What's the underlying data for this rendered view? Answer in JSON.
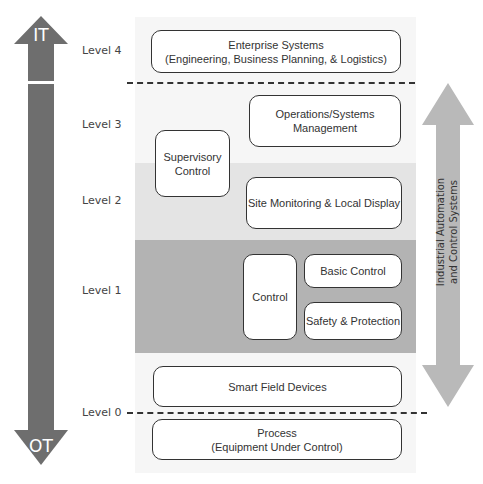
{
  "left_arrow": {
    "top_label": "IT",
    "bottom_label": "OT",
    "color": "#6e6e6e"
  },
  "levels": [
    {
      "label": "Level 4"
    },
    {
      "label": "Level 3"
    },
    {
      "label": "Level 2"
    },
    {
      "label": "Level 1"
    },
    {
      "label": "Level 0"
    }
  ],
  "boxes": {
    "enterprise": {
      "line1": "Enterprise Systems",
      "line2": "(Engineering, Business Planning, & Logistics)"
    },
    "operations": {
      "line1": "Operations/Systems",
      "line2": "Management"
    },
    "supervisory": {
      "line1": "Supervisory",
      "line2": "Control"
    },
    "site_monitoring": {
      "line1": "Site Monitoring & Local Display"
    },
    "control": {
      "line1": "Control"
    },
    "basic_control": {
      "line1": "Basic Control"
    },
    "safety": {
      "line1": "Safety & Protection"
    },
    "smart_field": {
      "line1": "Smart Field Devices"
    },
    "process": {
      "line1": "Process",
      "line2": "(Equipment Under Control)"
    }
  },
  "right_arrow": {
    "line1": "Industrial Automation",
    "line2": "and Control Systems",
    "color": "#b9b9b9"
  },
  "colors": {
    "panel": "#f6f6f6",
    "level2_band": "#e4e4e4",
    "level1_band": "#b3b3b3"
  }
}
